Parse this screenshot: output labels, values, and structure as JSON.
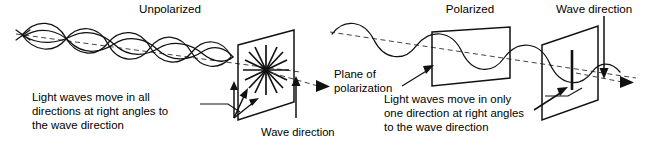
{
  "figure": {
    "background_color": "#ffffff",
    "ink_color": "#111111",
    "width": 656,
    "height": 148
  },
  "panels": {
    "left": {
      "heading": "Unpolarized",
      "caption_lines": [
        "Light waves move in all",
        "directions at right angles to",
        "the wave direction"
      ],
      "screen_label": "Wave direction",
      "wave_count": 4,
      "burst_ray_count": 8
    },
    "right": {
      "heading": "Polarized",
      "polarizer_label_lines": [
        "Plane of",
        "polarization"
      ],
      "caption_lines": [
        "Light waves move in only",
        "one direction at right angles",
        "to the wave direction"
      ],
      "screen_label": "Wave direction",
      "wave_count": 1,
      "polarization_axis": "vertical"
    }
  },
  "icons": {
    "propagation_axis": "dashed-arrow-icon",
    "direction_marker": "arrow-down-icon",
    "vibration_marker": "arrow-up-icon",
    "starburst": "starburst-icon",
    "polarized_slit": "vertical-bar-icon"
  }
}
